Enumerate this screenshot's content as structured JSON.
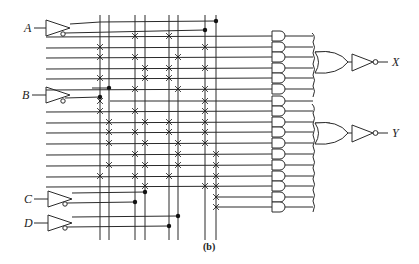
{
  "figure": {
    "caption": "(b)"
  },
  "inputs": [
    {
      "name": "A",
      "y": 28
    },
    {
      "name": "B",
      "y": 95
    },
    {
      "name": "C",
      "y": 198
    },
    {
      "name": "D",
      "y": 223
    }
  ],
  "outputs": [
    {
      "name": "X",
      "y": 62
    },
    {
      "name": "Y",
      "y": 133
    }
  ],
  "vertical_lines_x": [
    100,
    109,
    135,
    145,
    169,
    178,
    205,
    216
  ],
  "product_rows_y": [
    36,
    47,
    57,
    68,
    78,
    89,
    101,
    111,
    122,
    132,
    143,
    154,
    165,
    176,
    186,
    197,
    207
  ],
  "colors": {
    "line": "#2a2a2a",
    "background": "#ffffff"
  }
}
